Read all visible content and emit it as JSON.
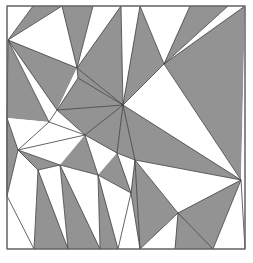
{
  "figure": {
    "kind": "geometric-triangulation",
    "canvas": {
      "width": 253,
      "height": 263
    },
    "frame": {
      "x": 7,
      "y": 6,
      "width": 238,
      "height": 243,
      "stroke": "#6e6e6e",
      "fill": "#ffffff"
    },
    "colors": {
      "gray_fill": "#939393",
      "white_fill": "#ffffff",
      "edge": "#3c3c3c",
      "frame_stroke": "#6e6e6e",
      "background": "#ffffff"
    },
    "counts": {
      "gray_triangles": 33,
      "white_triangles": 33,
      "total_triangles": 66
    }
  },
  "chart_data": {
    "type": "diagram",
    "xlabel": "",
    "ylabel": "",
    "xlim": [
      0,
      253
    ],
    "ylim": [
      0,
      263
    ],
    "grid": false,
    "legend": null,
    "vertices": {
      "tl": [
        7,
        6
      ],
      "tr": [
        245,
        6
      ],
      "bl": [
        7,
        249
      ],
      "br": [
        245,
        249
      ],
      "left_hub_top": [
        8,
        40
      ],
      "left_hub_mid": [
        18,
        150
      ],
      "left_edge_a": [
        7,
        118
      ],
      "left_edge_b": [
        7,
        196
      ],
      "top_a": [
        33,
        6
      ],
      "top_b": [
        62,
        6
      ],
      "top_c": [
        93,
        6
      ],
      "top_d": [
        121,
        6
      ],
      "top_e": [
        140,
        6
      ],
      "top_f": [
        190,
        6
      ],
      "top_g": [
        228,
        6
      ],
      "inner_1": [
        77,
        68
      ],
      "inner_2": [
        42,
        52
      ],
      "inner_3": [
        78,
        78
      ],
      "hub_center": [
        123,
        105
      ],
      "hub_upper_right": [
        164,
        64
      ],
      "inner_4": [
        57,
        110
      ],
      "inner_5": [
        49,
        122
      ],
      "inner_6": [
        85,
        135
      ],
      "inner_7": [
        117,
        153
      ],
      "inner_8": [
        60,
        165
      ],
      "inner_9": [
        38,
        170
      ],
      "inner_10": [
        98,
        175
      ],
      "right_hub": [
        241,
        180
      ],
      "inner_11": [
        135,
        160
      ],
      "inner_12": [
        131,
        193
      ],
      "inner_13": [
        178,
        213
      ],
      "bottom_a": [
        34,
        249
      ],
      "bottom_b": [
        68,
        249
      ],
      "bottom_c": [
        100,
        249
      ],
      "bottom_d": [
        118,
        249
      ],
      "bottom_e": [
        140,
        249
      ],
      "bottom_f": [
        175,
        249
      ],
      "bottom_g": [
        213,
        249
      ]
    },
    "triangles": [
      {
        "id": "t01",
        "points": "8,40 33,6 62,6",
        "fill": "gray"
      },
      {
        "id": "t02",
        "points": "8,40 62,6 77,68",
        "fill": "white"
      },
      {
        "id": "t03",
        "points": "62,6 93,6 77,68",
        "fill": "gray"
      },
      {
        "id": "t04",
        "points": "93,6 77,68 121,6",
        "fill": "white"
      },
      {
        "id": "t05",
        "points": "121,6 77,68 123,105",
        "fill": "gray"
      },
      {
        "id": "t06",
        "points": "121,6 123,105 140,6",
        "fill": "white"
      },
      {
        "id": "t07",
        "points": "140,6 123,105 164,64",
        "fill": "gray"
      },
      {
        "id": "t08",
        "points": "140,6 164,64 190,6",
        "fill": "white"
      },
      {
        "id": "t09",
        "points": "190,6 164,64 228,6",
        "fill": "gray"
      },
      {
        "id": "t10",
        "points": "228,6 164,64 245,6",
        "fill": "white"
      },
      {
        "id": "t11",
        "points": "245,6 164,64 241,180",
        "fill": "gray"
      },
      {
        "id": "t12",
        "points": "245,6 241,180 245,249",
        "fill": "white"
      },
      {
        "id": "t13",
        "points": "164,64 123,105 241,180",
        "fill": "white"
      },
      {
        "id": "t14",
        "points": "7,6 8,40 33,6",
        "fill": "white"
      },
      {
        "id": "t15",
        "points": "7,6 7,118 8,40",
        "fill": "white"
      },
      {
        "id": "t16",
        "points": "8,40 7,118 49,122",
        "fill": "gray"
      },
      {
        "id": "t17",
        "points": "8,40 49,122 57,110",
        "fill": "white"
      },
      {
        "id": "t18",
        "points": "8,40 57,110 77,68",
        "fill": "gray"
      },
      {
        "id": "t19",
        "points": "77,68 57,110 78,78",
        "fill": "white"
      },
      {
        "id": "t20",
        "points": "77,68 78,78 123,105",
        "fill": "gray"
      },
      {
        "id": "t21",
        "points": "78,78 57,110 123,105",
        "fill": "gray"
      },
      {
        "id": "t22",
        "points": "57,110 85,135 123,105",
        "fill": "gray"
      },
      {
        "id": "t23",
        "points": "57,110 49,122 85,135",
        "fill": "white"
      },
      {
        "id": "t24",
        "points": "49,122 18,150 85,135",
        "fill": "white"
      },
      {
        "id": "t25",
        "points": "7,118 18,150 49,122",
        "fill": "white"
      },
      {
        "id": "t26",
        "points": "7,118 7,196 18,150",
        "fill": "gray"
      },
      {
        "id": "t27",
        "points": "18,150 7,196 38,170",
        "fill": "white"
      },
      {
        "id": "t28",
        "points": "18,150 38,170 60,165",
        "fill": "gray"
      },
      {
        "id": "t29",
        "points": "18,150 60,165 85,135",
        "fill": "white"
      },
      {
        "id": "t30",
        "points": "85,135 60,165 98,175",
        "fill": "gray"
      },
      {
        "id": "t31",
        "points": "85,135 98,175 117,153",
        "fill": "white"
      },
      {
        "id": "t32",
        "points": "85,135 117,153 123,105",
        "fill": "gray"
      },
      {
        "id": "t33",
        "points": "123,105 117,153 135,160",
        "fill": "gray"
      },
      {
        "id": "t34",
        "points": "123,105 135,160 241,180",
        "fill": "gray"
      },
      {
        "id": "t35",
        "points": "135,160 117,153 131,193",
        "fill": "white"
      },
      {
        "id": "t36",
        "points": "117,153 98,175 131,193",
        "fill": "gray"
      },
      {
        "id": "t37",
        "points": "98,175 131,193 118,249",
        "fill": "white"
      },
      {
        "id": "t38",
        "points": "98,175 118,249 100,249",
        "fill": "gray"
      },
      {
        "id": "t39",
        "points": "60,165 98,175 100,249",
        "fill": "white"
      },
      {
        "id": "t40",
        "points": "60,165 100,249 68,249",
        "fill": "gray"
      },
      {
        "id": "t41",
        "points": "38,170 60,165 68,249",
        "fill": "white"
      },
      {
        "id": "t42",
        "points": "38,170 68,249 34,249",
        "fill": "gray"
      },
      {
        "id": "t43",
        "points": "7,196 38,170 34,249",
        "fill": "white"
      },
      {
        "id": "t44",
        "points": "7,196 34,249 7,249",
        "fill": "white"
      },
      {
        "id": "t45",
        "points": "131,193 135,160 140,249",
        "fill": "gray"
      },
      {
        "id": "t46",
        "points": "131,193 140,249 118,249",
        "fill": "white"
      },
      {
        "id": "t47",
        "points": "135,160 178,213 140,249",
        "fill": "gray"
      },
      {
        "id": "t48",
        "points": "135,160 241,180 178,213",
        "fill": "white"
      },
      {
        "id": "t49",
        "points": "178,213 175,249 140,249",
        "fill": "white"
      },
      {
        "id": "t50",
        "points": "178,213 213,249 175,249",
        "fill": "gray"
      },
      {
        "id": "t51",
        "points": "178,213 241,180 213,249",
        "fill": "gray"
      },
      {
        "id": "t52",
        "points": "241,180 245,249 213,249",
        "fill": "white"
      }
    ],
    "edges": [
      "7,6 245,6",
      "245,6 245,249",
      "245,249 7,249",
      "7,249 7,6",
      "8,40 33,6",
      "8,40 62,6",
      "62,6 77,68",
      "93,6 77,68",
      "77,68 121,6",
      "121,6 123,105",
      "123,105 140,6",
      "140,6 164,64",
      "164,64 190,6",
      "164,64 228,6",
      "164,64 245,6",
      "164,64 241,180",
      "164,64 123,105",
      "123,105 241,180",
      "8,40 7,118",
      "8,40 49,122",
      "8,40 57,110",
      "8,40 77,68",
      "77,68 78,78",
      "78,78 57,110",
      "78,78 123,105",
      "77,68 123,105",
      "57,110 123,105",
      "57,110 85,135",
      "57,110 49,122",
      "49,122 85,135",
      "49,122 18,150",
      "7,118 18,150",
      "7,118 7,196",
      "18,150 7,196",
      "18,150 38,170",
      "18,150 60,165",
      "18,150 85,135",
      "38,170 60,165",
      "60,165 98,175",
      "85,135 98,175",
      "85,135 117,153",
      "85,135 123,105",
      "117,153 123,105",
      "117,153 135,160",
      "123,105 135,160",
      "135,160 241,180",
      "117,153 131,193",
      "98,175 131,193",
      "98,175 118,249",
      "98,175 100,249",
      "60,165 100,249",
      "60,165 68,249",
      "38,170 68,249",
      "38,170 34,249",
      "7,196 34,249",
      "131,193 118,249",
      "131,193 140,249",
      "135,160 140,249",
      "135,160 178,213",
      "178,213 140,249",
      "178,213 175,249",
      "178,213 213,249",
      "178,213 241,180",
      "241,180 213,249",
      "241,180 245,249",
      "135,160 131,193"
    ]
  }
}
